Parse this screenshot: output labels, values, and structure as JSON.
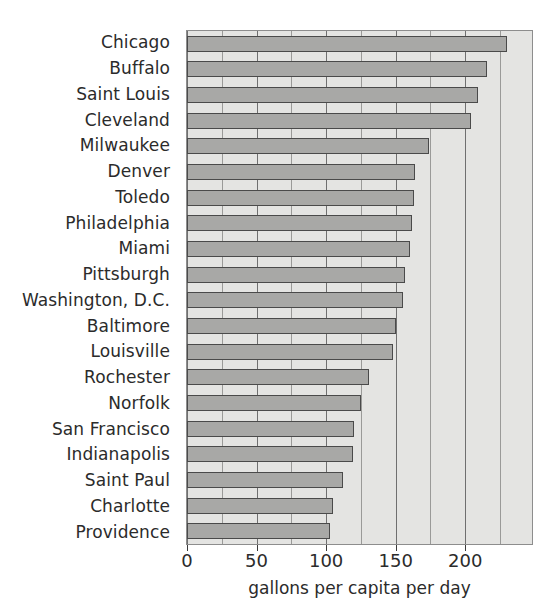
{
  "chart_data": {
    "type": "bar",
    "orientation": "horizontal",
    "title": "",
    "xlabel": "gallons per capita per day",
    "ylabel": "",
    "xlim": [
      0,
      248
    ],
    "xticks": [
      0,
      50,
      100,
      150,
      200
    ],
    "xticklabels": [
      "0",
      "50",
      "100",
      "150",
      "200"
    ],
    "minor_gridline_step": 25,
    "grid": true,
    "legend": null,
    "categories": [
      "Chicago",
      "Buffalo",
      "Saint Louis",
      "Cleveland",
      "Milwaukee",
      "Denver",
      "Toledo",
      "Philadelphia",
      "Miami",
      "Pittsburgh",
      "Washington, D.C.",
      "Baltimore",
      "Louisville",
      "Rochester",
      "Norfolk",
      "San Francisco",
      "Indianapolis",
      "Saint Paul",
      "Charlotte",
      "Providence"
    ],
    "values": [
      230,
      216,
      209,
      204,
      174,
      164,
      163,
      162,
      160,
      157,
      155,
      150,
      148,
      131,
      125,
      120,
      119,
      112,
      105,
      103
    ],
    "bar_fill_color": "#a8a8a6",
    "bar_edge_color": "#4a4a4a",
    "plot_background_color": "#e4e4e2",
    "gridline_color": "#6f6f6f"
  },
  "axis": {
    "x_title": "gallons per capita per day"
  }
}
